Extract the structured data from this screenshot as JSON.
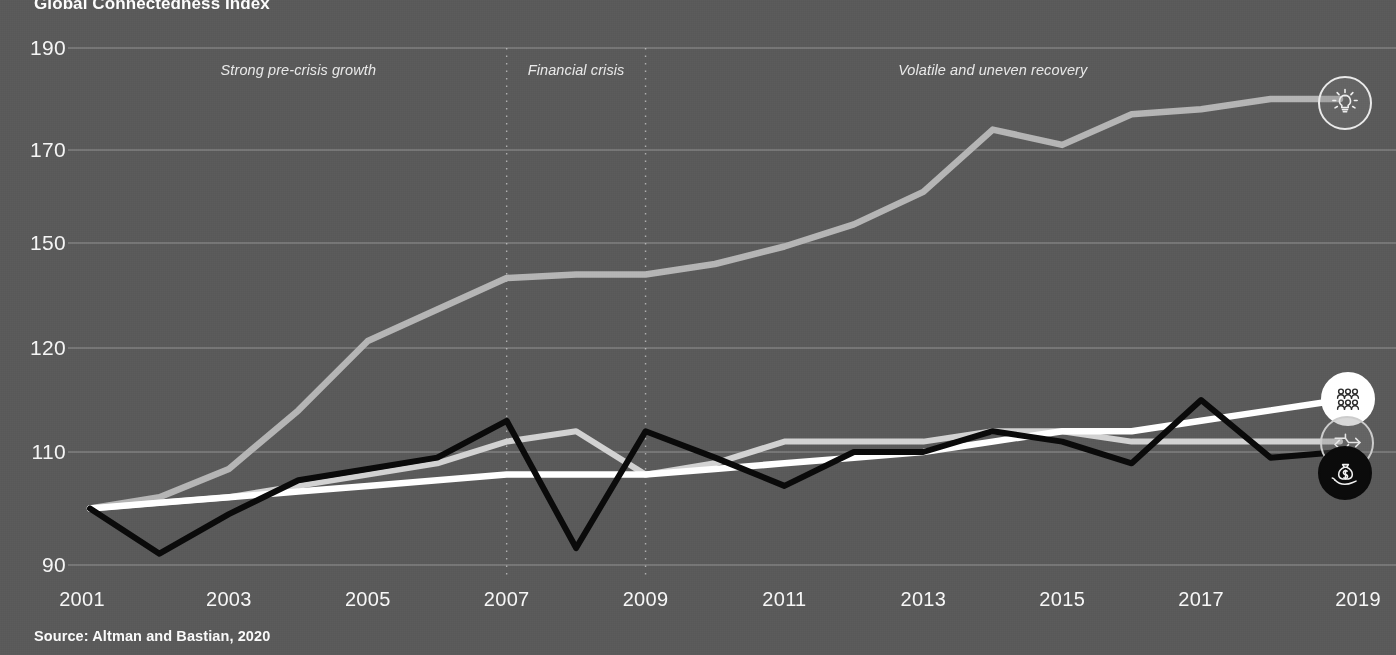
{
  "chart_title": "Global Connectedness Index",
  "source_note": "Source: Altman and Bastian, 2020",
  "axis": {
    "y_ticks": [
      "190",
      "170",
      "150",
      "120",
      "110",
      "90"
    ],
    "x_ticks": [
      "2001",
      "2003",
      "2005",
      "2007",
      "2009",
      "2011",
      "2013",
      "2015",
      "2017",
      "2019"
    ]
  },
  "annotations": [
    {
      "label": "Strong pre-crisis growth"
    },
    {
      "label": "Financial crisis"
    },
    {
      "label": "Volatile and uneven recovery"
    }
  ],
  "markers": [
    {
      "name": "information-marker",
      "icon": "lightbulb-icon"
    },
    {
      "name": "people-marker",
      "icon": "people-icon"
    },
    {
      "name": "trade-marker",
      "icon": "trade-icon"
    },
    {
      "name": "capital-marker",
      "icon": "money-bag-icon"
    }
  ],
  "colors": {
    "background": "#5a5a5a",
    "gridline": "#bfbfbf",
    "divider": "#cfcfcf",
    "information": "#b5b5b5",
    "people": "#ffffff",
    "trade": "#d2d2d2",
    "capital": "#0a0a0a",
    "text": "#f5f5f5"
  },
  "chart_data": {
    "type": "line",
    "title": "Global Connectedness Index",
    "xlabel": "",
    "ylabel": "",
    "x": [
      2001,
      2002,
      2003,
      2004,
      2005,
      2006,
      2007,
      2008,
      2009,
      2010,
      2011,
      2012,
      2013,
      2014,
      2015,
      2016,
      2017,
      2018,
      2019
    ],
    "xlim": [
      2001,
      2019
    ],
    "ylim": [
      90,
      190
    ],
    "y_tick_values": [
      190,
      170,
      150,
      120,
      110,
      90
    ],
    "grid": "horizontal",
    "legend": "none",
    "series": [
      {
        "name": "Information",
        "icon": "lightbulb-icon",
        "color": "#b5b5b5",
        "values": [
          100,
          102,
          107,
          114,
          122,
          131,
          140,
          141,
          141,
          144,
          149,
          154,
          161,
          174,
          171,
          177,
          178,
          180,
          180
        ]
      },
      {
        "name": "People",
        "icon": "people-icon",
        "color": "#ffffff",
        "values": [
          100,
          101,
          102,
          103,
          104,
          105,
          106,
          106,
          106,
          107,
          108,
          109,
          110,
          111,
          112,
          112,
          113,
          114,
          115
        ]
      },
      {
        "name": "Trade",
        "icon": "trade-icon",
        "color": "#d2d2d2",
        "values": [
          100,
          101,
          102,
          104,
          106,
          108,
          111,
          112,
          106,
          108,
          111,
          111,
          111,
          112,
          112,
          111,
          111,
          111,
          111
        ]
      },
      {
        "name": "Capital",
        "icon": "money-bag-icon",
        "color": "#0a0a0a",
        "values": [
          100,
          92,
          99,
          105,
          107,
          109,
          113,
          93,
          112,
          109,
          104,
          110,
          110,
          112,
          111,
          108,
          115,
          109,
          110
        ]
      }
    ],
    "dividers": [
      {
        "x": 2007,
        "label": "Financial crisis start"
      },
      {
        "x": 2009,
        "label": "Financial crisis end"
      }
    ],
    "annotations": [
      {
        "text": "Strong pre-crisis growth",
        "x": 2004
      },
      {
        "text": "Financial crisis",
        "x": 2008
      },
      {
        "text": "Volatile and uneven recovery",
        "x": 2014
      }
    ]
  }
}
